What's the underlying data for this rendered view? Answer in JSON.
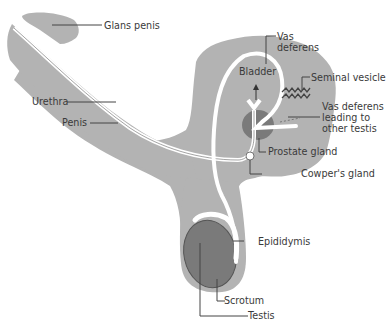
{
  "diagram": {
    "colors": {
      "tissue": "#b3b3b3",
      "organ": "#7a7a7a",
      "duct": "#ffffff",
      "outline": "#555555",
      "leader": "#444444",
      "text": "#3a3a3a"
    },
    "labels": {
      "glans_penis": "Glans penis",
      "urethra": "Urethra",
      "penis": "Penis",
      "vas_deferens": "Vas\ndeferens",
      "bladder": "Bladder",
      "seminal_vesicle": "Seminal vesicle",
      "vas_deferens_other": "Vas deferens\nleading to\nother testis",
      "prostate_gland": "Prostate gland",
      "cowpers_gland": "Cowper's gland",
      "epididymis": "Epididymis",
      "scrotum": "Scrotum",
      "testis": "Testis"
    }
  }
}
